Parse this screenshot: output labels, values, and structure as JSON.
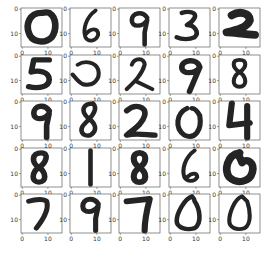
{
  "chart_data": {
    "type": "image-grid",
    "title": "",
    "rows": 5,
    "cols": 5,
    "image_size": [
      16,
      16
    ],
    "x_ticks": [
      "0",
      "10"
    ],
    "y_ticks": [
      "0",
      "10"
    ],
    "cmap": "gray_r",
    "labels": [
      [
        "0",
        "6",
        "9",
        "3",
        "2"
      ],
      [
        "5",
        "⇁",
        "2",
        "9",
        "8"
      ],
      [
        "9",
        "8",
        "2",
        "0",
        "4"
      ],
      [
        "8",
        "1",
        "8",
        "6",
        "0"
      ],
      [
        "7",
        "9",
        "7",
        "0",
        "0"
      ]
    ],
    "digits": [
      [
        {
          "d": "M8 2 C3 2 2 7 3 10 C4 14 9 15 12 12 C14 9 14 4 11 2 C10 1.5 9 2 8 2",
          "w": 2.6
        },
        {
          "d": "M10 1 C6 4 5 9 6 12 C7 14 10 14 11 11 C11 8 8 8 6 11",
          "w": 1.5
        },
        {
          "d": "M11 4 C9 1 5 2 5 5 C5 8 9 8 11 5 L10 10 L10 15",
          "w": 1.8
        },
        {
          "d": "M5 2 C8 1 11 2 10 4 C9 6 7 7 7 7 C10 7 12 10 10 12 C8 13 5 13 3 12",
          "w": 1.8
        },
        {
          "d": "M5 3 C8 1 12 2 12 5 C11 8 7 9 3 10 C6 10 10 11 14 11",
          "w": 3.2
        }
      ],
      [
        {
          "d": "M11 2 L5 2 L4 7 C7 6 11 7 11 10 C11 13 7 14 3 13",
          "w": 2.2
        },
        {
          "d": "M3 4 C6 2 10 3 11 6 C12 10 9 13 5 12 C3 11 2 9 1 8",
          "w": 1.6
        },
        {
          "d": "M5 4 C6 1 10 1 10 4 C9 8 6 11 3 14 M7 11 C9 12 11 13 13 14",
          "w": 1.6
        },
        {
          "d": "M12 5 C11 1 5 2 5 5 C5 8 10 8 12 5 L10 10 L8 15",
          "w": 2.2
        },
        {
          "d": "M8 2 C5 2 5 5 8 7 C11 9 11 13 8 13 C5 13 5 9 8 7 C11 5 11 2 8 2",
          "w": 1.6
        }
      ],
      [
        {
          "d": "M11 4 C9 1 5 2 5 5 C5 8 9 8 11 5 L10 10 L10 15",
          "w": 2.2
        },
        {
          "d": "M9 1 C5 1 4 4 7 7 C10 9 11 12 8 14 C5 15 3 12 6 9 C9 6 11 3 9 1",
          "w": 1.8
        },
        {
          "d": "M3 4 C6 1 11 2 10 6 C9 10 5 12 3 14 C7 13 11 14 14 14",
          "w": 2.2
        },
        {
          "d": "M7 3 C3 5 2 11 6 14 C10 16 13 12 12 6 C11 4 10 3 9 3",
          "w": 2.0
        },
        {
          "d": "M5 1 L4 10 L12 9 M11 2 L11 15",
          "w": 2.4
        }
      ],
      [
        {
          "d": "M8 2 C4 2 4 6 7 8 C10 10 10 14 7 14 C4 14 4 10 7 8 C10 6 11 2 8 2",
          "w": 2.2
        },
        {
          "d": "M8 1 L8 15",
          "w": 1.8
        },
        {
          "d": "M8 2 C5 2 5 6 8 8 C11 10 11 14 8 14 C5 14 5 10 8 8 C11 6 11 2 8 2",
          "w": 2.4
        },
        {
          "d": "M10 1 C6 4 5 9 6 12 C7 14 10 14 11 12 C11 10 9 10 7 12",
          "w": 1.6
        },
        {
          "d": "M8 2 C3 3 2 9 4 12 C7 15 12 14 13 10 C14 6 11 4 9 6 C8 3 7 3 8 2",
          "w": 3.0
        }
      ],
      [
        {
          "d": "M3 3 C6 2 9 2 10 3 C11 6 9 10 6 14",
          "w": 2.0
        },
        {
          "d": "M11 4 C9 1 5 2 5 5 C5 8 9 8 11 5 L10 10 L10 15",
          "w": 2.0
        },
        {
          "d": "M3 3 L12 2 C11 6 10 10 10 15",
          "w": 2.4
        },
        {
          "d": "M9 1 C6 2 3 8 3 11 C3 14 7 15 10 14 C13 12 12 6 10 3 C10 2 9 1 9 1",
          "w": 1.8
        },
        {
          "d": "M9 1 C6 2 4 8 4 11 C4 14 7 15 10 14 C13 12 12 6 11 3 C10 2 9 1 9 1",
          "w": 1.6
        }
      ]
    ]
  }
}
